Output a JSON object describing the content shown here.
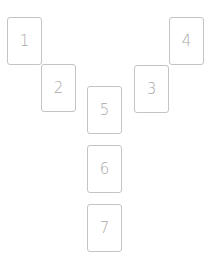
{
  "layout": {
    "title": "Card spread positions",
    "border_color": "#c4c4c4",
    "label_color": "#a8a8a8",
    "background": "#ffffff"
  },
  "cards": [
    {
      "label": "1",
      "x": 7,
      "y": 17
    },
    {
      "label": "2",
      "x": 41,
      "y": 64
    },
    {
      "label": "3",
      "x": 134,
      "y": 65
    },
    {
      "label": "4",
      "x": 169,
      "y": 17
    },
    {
      "label": "5",
      "x": 87,
      "y": 86
    },
    {
      "label": "6",
      "x": 87,
      "y": 145
    },
    {
      "label": "7",
      "x": 87,
      "y": 204
    }
  ]
}
